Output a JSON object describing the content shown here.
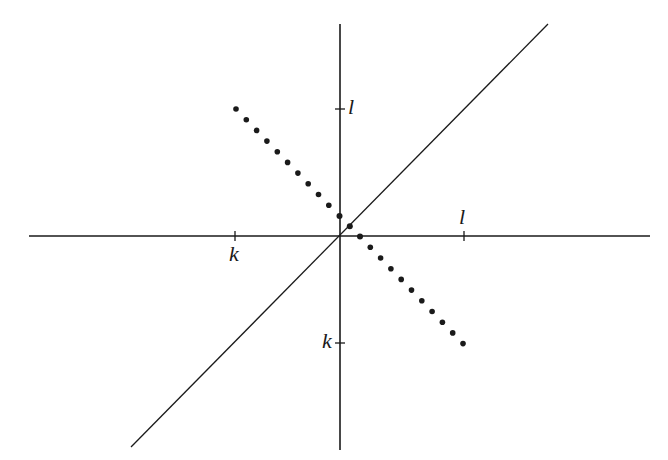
{
  "diagram": {
    "colors": {
      "background": "#ffffff",
      "ink": "#1a1a1a"
    },
    "origin_px": [
      339,
      236
    ],
    "unit_px": {
      "l": 125,
      "k": -104
    },
    "axes": {
      "x_axis": {
        "from_px": [
          29,
          236
        ],
        "to_px": [
          650,
          236
        ]
      },
      "y_axis": {
        "from_px": [
          340,
          24
        ],
        "to_px": [
          340,
          450
        ]
      }
    },
    "diagonal_line": {
      "equation": "y = x",
      "from_px": [
        131,
        447
      ],
      "to_px": [
        548,
        24
      ]
    },
    "dotted_segment": {
      "equation": "x + y = k + l",
      "from": "(k, l)",
      "to": "(l, k)",
      "from_px": [
        236,
        109
      ],
      "to_px": [
        463,
        344
      ],
      "dot_count": 23
    },
    "highlighted_points": [
      {
        "name": "y-axis-intercept",
        "coords": "(0, k+l)",
        "px": [
          339,
          216
        ]
      },
      {
        "name": "diagonal-intersection",
        "coords": "((k+l)/2, (k+l)/2)",
        "px": [
          350,
          226
        ]
      },
      {
        "name": "x-axis-intercept",
        "coords": "(k+l, 0)",
        "px": [
          360,
          236
        ]
      }
    ],
    "ticks": [
      {
        "axis": "y",
        "label": "l",
        "px": [
          340,
          109
        ]
      },
      {
        "axis": "x",
        "label": "l",
        "px": [
          464,
          236
        ]
      },
      {
        "axis": "x",
        "label": "k",
        "px": [
          235,
          236
        ]
      },
      {
        "axis": "y",
        "label": "k",
        "px": [
          340,
          343
        ]
      }
    ],
    "labels": {
      "y_tick_l": "l",
      "x_tick_l": "l",
      "x_tick_k": "k",
      "y_tick_k": "k"
    }
  }
}
